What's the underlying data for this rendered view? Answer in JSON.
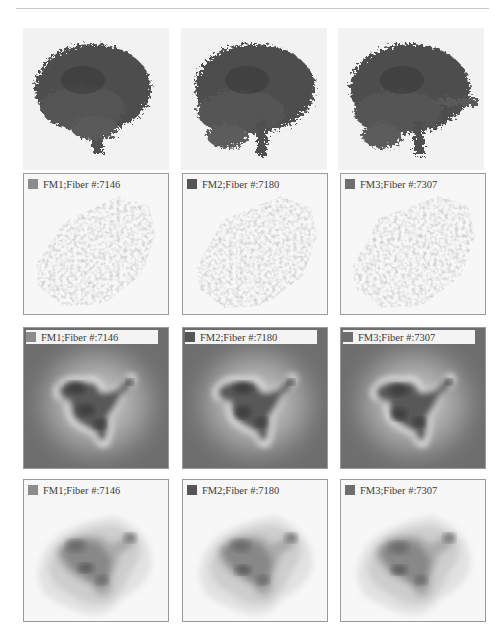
{
  "figure": {
    "rows": [
      {
        "type": "fiber-render",
        "panels": [
          {
            "id": "FM1"
          },
          {
            "id": "FM2"
          },
          {
            "id": "FM3"
          }
        ]
      },
      {
        "type": "scatter-embedding",
        "panels": [
          {
            "label": "FM1;Fiber #:7146",
            "swatch": "#8c8c8c"
          },
          {
            "label": "FM2;Fiber #:7180",
            "swatch": "#555555"
          },
          {
            "label": "FM3;Fiber #:7307",
            "swatch": "#6e6e6e"
          }
        ]
      },
      {
        "type": "density-heatmap",
        "panels": [
          {
            "label": "FM1;Fiber #:7146",
            "swatch": "#8c8c8c"
          },
          {
            "label": "FM2;Fiber #:7180",
            "swatch": "#555555"
          },
          {
            "label": "FM3;Fiber #:7307",
            "swatch": "#6e6e6e"
          }
        ]
      },
      {
        "type": "density-contour",
        "panels": [
          {
            "label": "FM1;Fiber #:7146",
            "swatch": "#8c8c8c"
          },
          {
            "label": "FM2;Fiber #:7180",
            "swatch": "#555555"
          },
          {
            "label": "FM3;Fiber #:7307",
            "swatch": "#6e6e6e"
          }
        ]
      }
    ]
  },
  "colors": {
    "fiber": "#4a4a4a",
    "scatter": "#9a9a9a",
    "heat_bg": "#6e6e6e",
    "panel_border": "#9a9a9a"
  }
}
